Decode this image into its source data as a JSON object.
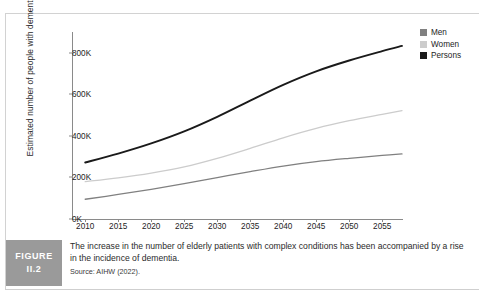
{
  "figure": {
    "badge_line1": "FIGURE",
    "badge_line2": "II.2",
    "caption": "The increase in the number of elderly patients with complex conditions has been accompanied by a rise in the incidence of dementia.",
    "source": "Source: AIHW (2022)."
  },
  "colors": {
    "men": "#808080",
    "women": "#cccccc",
    "persons": "#1a1a1a",
    "axis": "#8a8a8a",
    "badge_bg": "#9a9a9a",
    "text": "#1d1d1d"
  },
  "chart_data": {
    "type": "line",
    "title": "",
    "xlabel": "",
    "ylabel": "Estimated number of people with dementia",
    "xlim": [
      2008,
      2058
    ],
    "ylim": [
      0,
      900000
    ],
    "grid": false,
    "legend_position": "right",
    "xticks": [
      2010,
      2015,
      2020,
      2025,
      2030,
      2035,
      2040,
      2045,
      2050,
      2055
    ],
    "xtick_labels": [
      "2010",
      "2015",
      "2020",
      "2025",
      "2030",
      "2035",
      "2040",
      "2045",
      "2050",
      "2055"
    ],
    "yticks": [
      0,
      200000,
      400000,
      600000,
      800000
    ],
    "ytick_labels": [
      "0K",
      "200K",
      "400K",
      "600K",
      "800K"
    ],
    "x": [
      2010,
      2015,
      2020,
      2025,
      2030,
      2035,
      2040,
      2045,
      2050,
      2055,
      2058
    ],
    "series": [
      {
        "name": "Men",
        "color": "#808080",
        "values": [
          95000,
          118000,
          143000,
          170000,
          199000,
          228000,
          255000,
          276000,
          292000,
          306000,
          313000
        ]
      },
      {
        "name": "Women",
        "color": "#cccccc",
        "values": [
          180000,
          198000,
          221000,
          251000,
          292000,
          340000,
          391000,
          436000,
          473000,
          504000,
          522000
        ]
      },
      {
        "name": "Persons",
        "color": "#1a1a1a",
        "values": [
          272000,
          315000,
          364000,
          422000,
          492000,
          570000,
          646000,
          711000,
          763000,
          808000,
          833000
        ]
      }
    ]
  }
}
